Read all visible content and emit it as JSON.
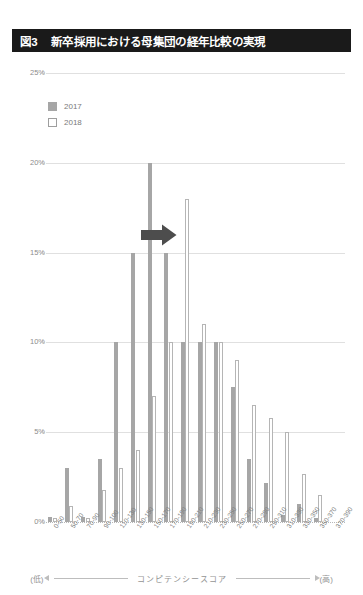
{
  "figure": {
    "number": "図3",
    "title": "新卒採用における母集団の経年比較の実現"
  },
  "legend": {
    "items": [
      {
        "label": "2017",
        "style": "filled",
        "color": "#a6a6a6"
      },
      {
        "label": "2018",
        "style": "outlined",
        "color": "#ffffff"
      }
    ]
  },
  "axis_caption": {
    "low": "(低)",
    "high": "(高)",
    "text": "コンピテンシースコア"
  },
  "annotation": {
    "type": "right-arrow",
    "color": "#4d4d4d",
    "near_category": "150-170"
  },
  "colors": {
    "title_bar_bg": "#1a1a1a",
    "title_bar_text": "#ffffff",
    "series_2017": "#a6a6a6",
    "series_2018_border": "#b5b5b5",
    "gridline": "#d2d2d2",
    "axis_text": "#808080"
  },
  "chart_data": {
    "type": "bar",
    "title": "新卒採用における母集団の経年比較の実現",
    "xlabel": "コンピテンシースコア",
    "ylabel": "",
    "ylim": [
      0,
      25
    ],
    "yticks": [
      0,
      5,
      10,
      15,
      20,
      25
    ],
    "ytick_labels": [
      "0%",
      "5%",
      "10%",
      "15%",
      "20%",
      "25%"
    ],
    "grid": true,
    "legend_position": "upper-left",
    "categories": [
      "0-50",
      "50-70",
      "70-90",
      "90-100",
      "110-130",
      "130-150",
      "150-170",
      "170-190",
      "190-210",
      "210-230",
      "230-250",
      "250-270",
      "270-290",
      "290-310",
      "310-330",
      "330-350",
      "350-370",
      "370-390"
    ],
    "series": [
      {
        "name": "2017",
        "values": [
          0.3,
          3.0,
          0.3,
          3.5,
          10.0,
          15.0,
          20.0,
          15.0,
          10.0,
          10.0,
          10.0,
          7.5,
          3.5,
          2.2,
          0.4,
          1.0,
          0.2,
          0.0
        ]
      },
      {
        "name": "2018",
        "values": [
          0.2,
          0.9,
          0.2,
          1.8,
          3.0,
          4.0,
          7.0,
          10.0,
          18.0,
          11.0,
          10.0,
          9.0,
          6.5,
          5.8,
          5.0,
          2.7,
          1.5,
          0.0
        ]
      }
    ]
  }
}
